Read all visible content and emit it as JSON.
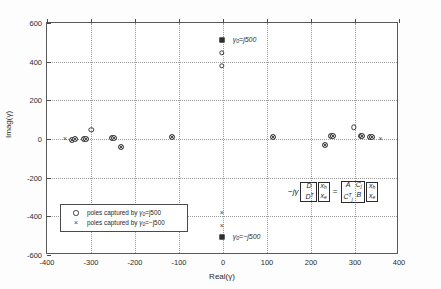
{
  "figure": {
    "background_color": "#ffffff",
    "frame_color": "#5a5a5a",
    "grid_color": "#9a9a9a",
    "marker_color": "#3a3a3a"
  },
  "axes": {
    "xlabel": "Real(γ)",
    "ylabel": "Imag(γ)",
    "xticks": [
      "-400",
      "-300",
      "-200",
      "-100",
      "0",
      "100",
      "200",
      "300",
      "400"
    ],
    "yticks": [
      "600",
      "400",
      "200",
      "0",
      "-200",
      "-400",
      "-600"
    ]
  },
  "legend": {
    "rows": [
      {
        "marker": "circle-marker",
        "text_prefix": "poles captured by ",
        "symbol": "γ",
        "subscript": "0",
        "text_suffix": "=j500"
      },
      {
        "marker": "cross-marker",
        "text_prefix": "poles captured by ",
        "symbol": "γ",
        "subscript": "0",
        "text_suffix": "=−j500"
      }
    ]
  },
  "annotations": {
    "top": {
      "symbol": "γ",
      "subscript": "0",
      "text": "=j500"
    },
    "bottom": {
      "symbol": "γ",
      "subscript": "0",
      "text": "=−j500"
    }
  },
  "equation": {
    "lead": "−jγ",
    "left_matrix": {
      "cells": [
        "D",
        "D"
      ],
      "superscripts": [
        "",
        "T"
      ]
    },
    "left_vector": {
      "cells": [
        "x",
        "x"
      ],
      "subscripts": [
        "h",
        "e"
      ]
    },
    "equals": "=",
    "right_matrix": {
      "cells": [
        "A",
        "C",
        "C",
        "B"
      ],
      "subscripts": [
        "",
        "j",
        "j",
        ""
      ],
      "superscripts": [
        "",
        "",
        "T",
        ""
      ]
    },
    "right_vector": {
      "cells": [
        "x",
        "x"
      ],
      "subscripts": [
        "h",
        "e"
      ]
    }
  },
  "chart_data": {
    "type": "scatter",
    "title": "",
    "xlabel": "Real(γ)",
    "ylabel": "Imag(γ)",
    "xlim": [
      -400,
      400
    ],
    "ylim": [
      -600,
      600
    ],
    "xticks": [
      -400,
      -300,
      -200,
      -100,
      0,
      100,
      200,
      300,
      400
    ],
    "yticks": [
      -600,
      -400,
      -200,
      0,
      200,
      400,
      600
    ],
    "grid": true,
    "legend_position": "lower-left",
    "series": [
      {
        "name": "poles captured by γ0=j500",
        "marker": "o",
        "points": [
          [
            -343,
            -3
          ],
          [
            -337,
            -2
          ],
          [
            -315,
            0
          ],
          [
            -312,
            1
          ],
          [
            -299,
            48
          ],
          [
            -252,
            5
          ],
          [
            -248,
            4
          ],
          [
            -231,
            -40
          ],
          [
            -117,
            9
          ],
          [
            113,
            11
          ],
          [
            231,
            -30
          ],
          [
            246,
            13
          ],
          [
            249,
            14
          ],
          [
            297,
            60
          ],
          [
            313,
            14
          ],
          [
            316,
            15
          ],
          [
            334,
            9
          ],
          [
            339,
            8
          ],
          [
            -3,
            445
          ],
          [
            -3,
            380
          ]
        ]
      },
      {
        "name": "poles captured by γ0=-j500",
        "marker": "x",
        "points": [
          [
            -359,
            -2
          ],
          [
            -343,
            -3
          ],
          [
            -337,
            -2
          ],
          [
            -315,
            0
          ],
          [
            -312,
            1
          ],
          [
            -252,
            5
          ],
          [
            -248,
            4
          ],
          [
            -231,
            -40
          ],
          [
            -117,
            9
          ],
          [
            113,
            11
          ],
          [
            231,
            -30
          ],
          [
            246,
            13
          ],
          [
            249,
            14
          ],
          [
            313,
            14
          ],
          [
            316,
            15
          ],
          [
            334,
            9
          ],
          [
            339,
            8
          ],
          [
            358,
            2
          ],
          [
            -3,
            -385
          ],
          [
            -3,
            -450
          ]
        ]
      },
      {
        "name": "shift points",
        "marker": "s",
        "points": [
          [
            -3,
            510
          ],
          [
            -3,
            -505
          ]
        ]
      }
    ]
  }
}
